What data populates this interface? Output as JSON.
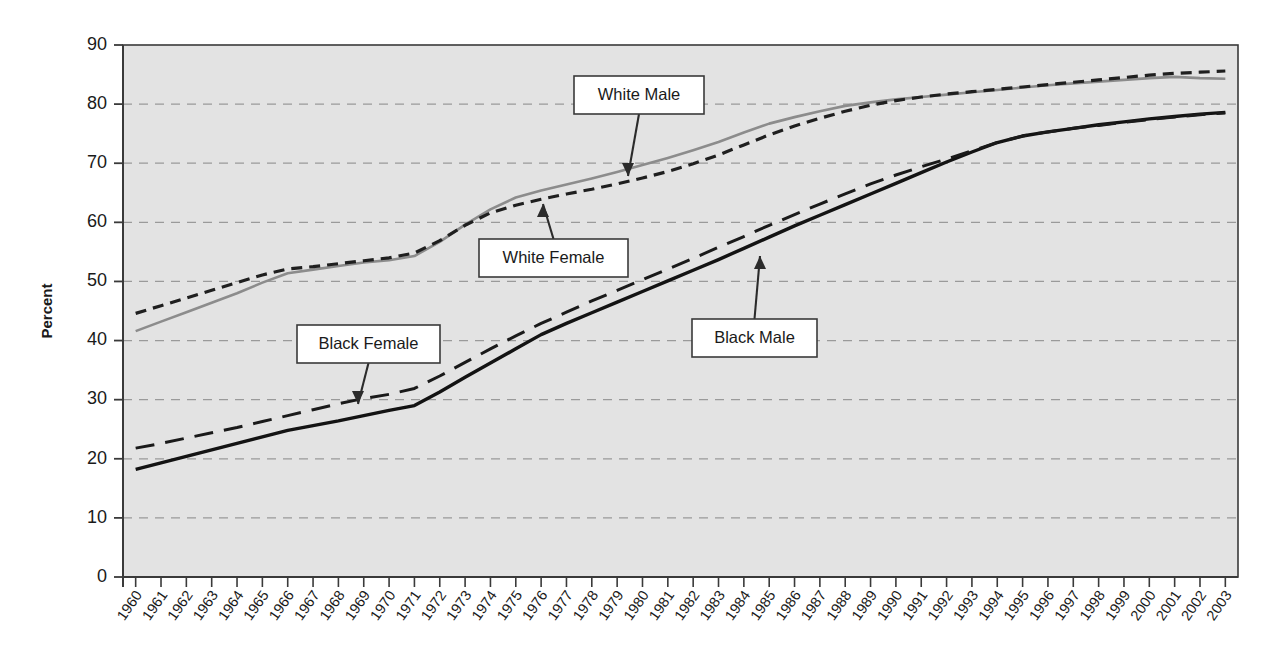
{
  "chart_data": {
    "type": "line",
    "title": "",
    "xlabel": "",
    "ylabel": "Percent",
    "ylim": [
      0,
      90
    ],
    "ytick_step": 10,
    "yticks": [
      0,
      10,
      20,
      30,
      40,
      50,
      60,
      70,
      80,
      90
    ],
    "grid": "horizontal-dashed",
    "legend": "annotated-callouts",
    "plot_background": "#e3e3e3",
    "x": [
      1960,
      1961,
      1962,
      1963,
      1964,
      1965,
      1966,
      1967,
      1968,
      1969,
      1970,
      1971,
      1972,
      1973,
      1974,
      1975,
      1976,
      1977,
      1978,
      1979,
      1980,
      1981,
      1982,
      1983,
      1984,
      1985,
      1986,
      1987,
      1988,
      1989,
      1990,
      1991,
      1992,
      1993,
      1994,
      1995,
      1996,
      1997,
      1998,
      1999,
      2000,
      2001,
      2002,
      2003
    ],
    "categories": [
      "1960",
      "1961",
      "1962",
      "1963",
      "1964",
      "1965",
      "1966",
      "1967",
      "1968",
      "1969",
      "1970",
      "1971",
      "1972",
      "1973",
      "1974",
      "1975",
      "1976",
      "1977",
      "1978",
      "1979",
      "1980",
      "1981",
      "1982",
      "1983",
      "1984",
      "1985",
      "1986",
      "1987",
      "1988",
      "1989",
      "1990",
      "1991",
      "1992",
      "1993",
      "1994",
      "1995",
      "1996",
      "1997",
      "1998",
      "1999",
      "2000",
      "2001",
      "2002",
      "2003"
    ],
    "series": [
      {
        "name": "White Male",
        "style": "solid",
        "color": "#8c8c8c",
        "values": [
          41.6,
          43.2,
          44.8,
          46.4,
          48.0,
          49.8,
          51.4,
          52.0,
          52.6,
          53.2,
          53.6,
          54.3,
          56.7,
          59.6,
          62.2,
          64.2,
          65.4,
          66.4,
          67.4,
          68.5,
          69.7,
          70.9,
          72.2,
          73.6,
          75.2,
          76.7,
          77.8,
          78.8,
          79.7,
          80.3,
          80.8,
          81.2,
          81.6,
          82.0,
          82.4,
          82.8,
          83.2,
          83.5,
          83.8,
          84.1,
          84.4,
          84.6,
          84.4,
          84.3
        ]
      },
      {
        "name": "White Female",
        "style": "dotted-dash",
        "color": "#1f1f1f",
        "values": [
          44.6,
          45.9,
          47.2,
          48.5,
          49.8,
          51.1,
          52.1,
          52.5,
          53.0,
          53.5,
          54.0,
          54.8,
          56.9,
          59.5,
          61.6,
          62.9,
          63.9,
          64.8,
          65.6,
          66.5,
          67.5,
          68.6,
          69.9,
          71.4,
          73.1,
          74.8,
          76.3,
          77.6,
          78.8,
          79.8,
          80.6,
          81.2,
          81.7,
          82.1,
          82.5,
          82.9,
          83.3,
          83.7,
          84.1,
          84.5,
          84.9,
          85.2,
          85.4,
          85.6
        ]
      },
      {
        "name": "Black Male",
        "style": "solid-thick",
        "color": "#131313",
        "values": [
          18.2,
          19.3,
          20.4,
          21.5,
          22.6,
          23.7,
          24.8,
          25.6,
          26.4,
          27.3,
          28.2,
          29.0,
          31.3,
          33.8,
          36.2,
          38.6,
          41.0,
          42.9,
          44.7,
          46.5,
          48.3,
          50.1,
          51.9,
          53.7,
          55.6,
          57.5,
          59.4,
          61.2,
          63.0,
          64.8,
          66.6,
          68.4,
          70.2,
          71.9,
          73.5,
          74.6,
          75.3,
          75.9,
          76.5,
          77.0,
          77.5,
          77.9,
          78.3,
          78.6
        ]
      },
      {
        "name": "Black Female",
        "style": "long-dash",
        "color": "#1a1a1a",
        "values": [
          21.8,
          22.6,
          23.5,
          24.4,
          25.3,
          26.3,
          27.3,
          28.3,
          29.3,
          30.2,
          30.9,
          31.9,
          34.0,
          36.3,
          38.6,
          40.8,
          42.9,
          44.8,
          46.7,
          48.5,
          50.3,
          52.1,
          53.9,
          55.8,
          57.6,
          59.5,
          61.3,
          63.1,
          64.8,
          66.5,
          68.0,
          69.4,
          70.7,
          72.1,
          73.5,
          74.6,
          75.3,
          75.9,
          76.4,
          76.9,
          77.4,
          77.8,
          78.2,
          78.5
        ]
      }
    ],
    "annotations": [
      {
        "label": "White Male",
        "arrow": "down",
        "points_to_series": "White Male",
        "box_x": 574,
        "box_y": 76,
        "box_w": 130,
        "box_h": 38,
        "tip_x": 628,
        "tip_y": 176
      },
      {
        "label": "White Female",
        "arrow": "up",
        "points_to_series": "White Female",
        "box_x": 479,
        "box_y": 239,
        "box_w": 149,
        "box_h": 38,
        "tip_x": 543,
        "tip_y": 204
      },
      {
        "label": "Black Female",
        "arrow": "down",
        "points_to_series": "Black Female",
        "box_x": 297,
        "box_y": 325,
        "box_w": 143,
        "box_h": 38,
        "tip_x": 358,
        "tip_y": 404
      },
      {
        "label": "Black Male",
        "arrow": "up",
        "points_to_series": "Black Male",
        "box_x": 692,
        "box_y": 319,
        "box_w": 125,
        "box_h": 38,
        "tip_x": 760,
        "tip_y": 256
      }
    ]
  },
  "axes": {
    "y_label": "Percent",
    "y_tick_labels": [
      "90",
      "80",
      "70",
      "60",
      "50",
      "40",
      "30",
      "20",
      "10",
      "0"
    ],
    "x_tick_labels": [
      "1960",
      "1961",
      "1962",
      "1963",
      "1964",
      "1965",
      "1966",
      "1967",
      "1968",
      "1969",
      "1970",
      "1971",
      "1972",
      "1973",
      "1974",
      "1975",
      "1976",
      "1977",
      "1978",
      "1979",
      "1980",
      "1981",
      "1982",
      "1983",
      "1984",
      "1985",
      "1986",
      "1987",
      "1988",
      "1989",
      "1990",
      "1991",
      "1992",
      "1993",
      "1994",
      "1995",
      "1996",
      "1997",
      "1998",
      "1999",
      "2000",
      "2001",
      "2002",
      "2003"
    ]
  },
  "colors": {
    "plot_bg": "#e3e3e3",
    "page_bg": "#ffffff",
    "axis": "#3a3a3a",
    "grid": "#9a9a9a",
    "white_male": "#8c8c8c",
    "white_female": "#1f1f1f",
    "black_male": "#131313",
    "black_female": "#1a1a1a"
  }
}
